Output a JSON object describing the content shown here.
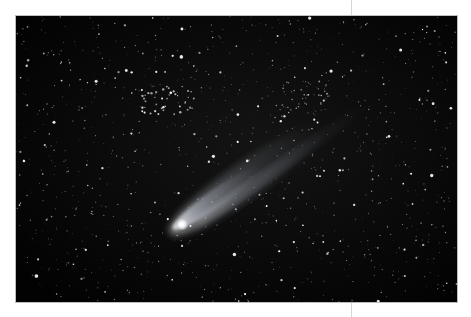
{
  "photo": {
    "subject": "comet with tail in star field",
    "alt": "Comet with bright nucleus and diffuse tail against a dense field of stars",
    "colors": {
      "sky": "#030303",
      "star": "#ffffff",
      "tail": "#cfd6e6"
    },
    "nucleus": {
      "x": 167,
      "y": 210
    },
    "tail_angle_deg": -35
  }
}
